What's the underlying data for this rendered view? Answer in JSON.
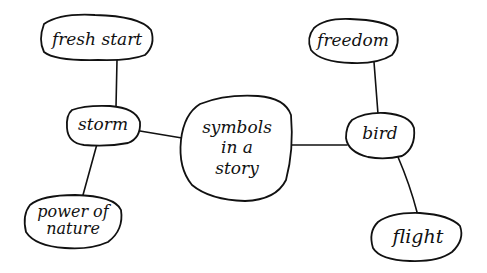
{
  "diagram": {
    "type": "mind-map",
    "style": "hand-drawn",
    "colors": {
      "ink": "#111111",
      "background": "#ffffff"
    },
    "center": {
      "id": "center",
      "label": "symbols\nin a\nstory"
    },
    "nodes": [
      {
        "id": "fresh-start",
        "label": "fresh start"
      },
      {
        "id": "storm",
        "label": "storm"
      },
      {
        "id": "power-of-nature",
        "label": "power of\nnature"
      },
      {
        "id": "freedom",
        "label": "freedom"
      },
      {
        "id": "bird",
        "label": "bird"
      },
      {
        "id": "flight",
        "label": "flight"
      }
    ],
    "edges": [
      {
        "from": "center",
        "to": "storm"
      },
      {
        "from": "center",
        "to": "bird"
      },
      {
        "from": "storm",
        "to": "fresh-start"
      },
      {
        "from": "storm",
        "to": "power-of-nature"
      },
      {
        "from": "bird",
        "to": "freedom"
      },
      {
        "from": "bird",
        "to": "flight"
      }
    ]
  }
}
